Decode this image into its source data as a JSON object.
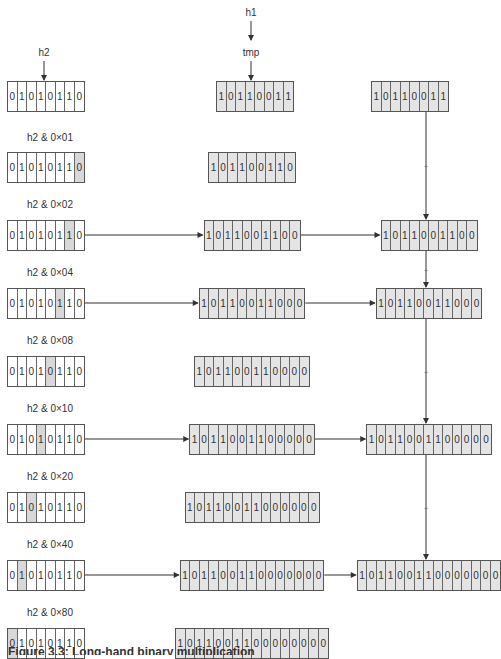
{
  "labels": {
    "h1": "h1",
    "h2": "h2",
    "tmp": "tmp"
  },
  "colors": {
    "register_fill": "#e4e4e4",
    "bit_highlight": "#d8d8d8",
    "line": "#333333"
  },
  "top_row": {
    "h2_bits": [
      "0",
      "1",
      "0",
      "1",
      "0",
      "1",
      "1",
      "0"
    ],
    "tmp_bits": [
      "1",
      "0",
      "1",
      "1",
      "0",
      "0",
      "1",
      "1"
    ],
    "acc_bits": [
      "1",
      "0",
      "1",
      "1",
      "0",
      "0",
      "1",
      "1"
    ]
  },
  "rows": [
    {
      "label": "h2 & 0×01",
      "mask_index": 7,
      "shifted": "101100110",
      "selected": false,
      "acc": ""
    },
    {
      "label": "h2 & 0×02",
      "mask_index": 6,
      "shifted": "1011001100",
      "selected": true,
      "acc": "1011001100"
    },
    {
      "label": "h2 & 0×04",
      "mask_index": 5,
      "shifted": "10110011000",
      "selected": true,
      "acc": "10110011000"
    },
    {
      "label": "h2 & 0×08",
      "mask_index": 4,
      "shifted": "101100110000",
      "selected": false,
      "acc": ""
    },
    {
      "label": "h2 & 0×10",
      "mask_index": 3,
      "shifted": "1011001100000",
      "selected": true,
      "acc": "1011001100000"
    },
    {
      "label": "h2 & 0×20",
      "mask_index": 2,
      "shifted": "10110011000000",
      "selected": false,
      "acc": ""
    },
    {
      "label": "h2 & 0×40",
      "mask_index": 1,
      "shifted": "101100110000000",
      "selected": true,
      "acc": "101100110000000"
    },
    {
      "label": "h2 & 0×80",
      "mask_index": 0,
      "shifted": "1011001100000000",
      "selected": false,
      "acc": ""
    }
  ],
  "h2_value": "01010110",
  "plus_symbol": "+",
  "caption": "Figure 3.3: Long-hand binary multiplication"
}
